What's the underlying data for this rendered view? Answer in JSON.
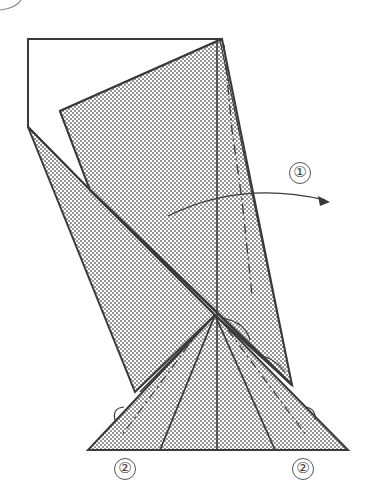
{
  "diagram": {
    "type": "origami-fold-instructions",
    "colors": {
      "line": "#3a3a3a",
      "dot": "#6a6a6a",
      "paper": "#ffffff",
      "shade_bg": "#e8e8e8"
    },
    "steps": [
      {
        "id": "step-1",
        "label": "①",
        "description": "fold flap to the right (valley fold along dashed line)"
      },
      {
        "id": "step-2-left",
        "label": "②",
        "description": "fold left corner inside"
      },
      {
        "id": "step-2-right",
        "label": "②",
        "description": "fold right corner inside"
      }
    ],
    "partial_circle_top_left": true
  }
}
